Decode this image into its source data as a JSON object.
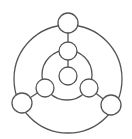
{
  "diagram": {
    "type": "concentric-node-graph",
    "stroke_color": "#555555",
    "background": "#ffffff",
    "rings": [
      {
        "id": "outer-ring",
        "cx": 68,
        "cy": 79,
        "r": 54
      },
      {
        "id": "inner-ring",
        "cx": 67,
        "cy": 75,
        "r": 25
      }
    ],
    "nodes": [
      {
        "id": "outer-top",
        "cx": 68,
        "cy": 23,
        "r": 10
      },
      {
        "id": "outer-left",
        "cx": 22,
        "cy": 103,
        "r": 10
      },
      {
        "id": "outer-right",
        "cx": 111,
        "cy": 105,
        "r": 10
      },
      {
        "id": "inner-top",
        "cx": 68,
        "cy": 51,
        "r": 9
      },
      {
        "id": "inner-left",
        "cx": 45,
        "cy": 88,
        "r": 9
      },
      {
        "id": "inner-right",
        "cx": 89,
        "cy": 88,
        "r": 9
      },
      {
        "id": "center",
        "cx": 68,
        "cy": 76,
        "r": 9
      }
    ],
    "edges": [
      {
        "from": "outer-top",
        "to": "inner-top"
      },
      {
        "from": "inner-top",
        "to": "center"
      },
      {
        "from": "outer-left",
        "to": "inner-left"
      },
      {
        "from": "outer-right",
        "to": "inner-right"
      }
    ]
  }
}
